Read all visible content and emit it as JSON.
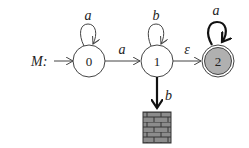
{
  "machine": {
    "name": "M:",
    "states": [
      {
        "id": "0",
        "label": "0",
        "start": true,
        "accepting": false,
        "fill": "#ffffff"
      },
      {
        "id": "1",
        "label": "1",
        "start": false,
        "accepting": false,
        "fill": "#ffffff"
      },
      {
        "id": "2",
        "label": "2",
        "start": false,
        "accepting": true,
        "fill": "#b0b0b0"
      }
    ],
    "transitions": [
      {
        "from": "0",
        "to": "0",
        "label": "a"
      },
      {
        "from": "0",
        "to": "1",
        "label": "a"
      },
      {
        "from": "1",
        "to": "1",
        "label": "b"
      },
      {
        "from": "1",
        "to": "2",
        "label": "ε"
      },
      {
        "from": "2",
        "to": "2",
        "label": "a"
      },
      {
        "from": "1",
        "to": "dead",
        "label": "b"
      }
    ],
    "dead_state": {
      "icon": "brick-wall-icon",
      "color": "#8a8a8a"
    }
  }
}
